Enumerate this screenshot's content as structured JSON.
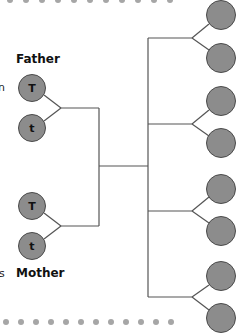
{
  "labels": {
    "father": "Father",
    "mother": "Mother"
  },
  "edge_fragments": {
    "top": "n",
    "bottom": "s"
  },
  "father_alleles": [
    "T",
    "t"
  ],
  "mother_alleles": [
    "T",
    "t"
  ],
  "offspring_count": 8,
  "colors": {
    "circle_fill": "#8c8c8c",
    "circle_border": "#4a4a4a",
    "line": "#555555",
    "dots": "#a6a6a6"
  }
}
